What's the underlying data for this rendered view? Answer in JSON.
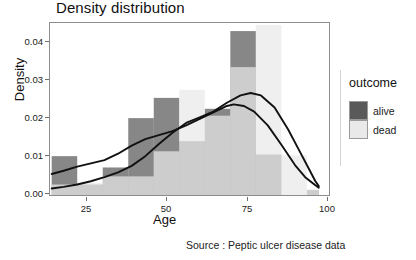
{
  "chart_data": {
    "type": "bar",
    "title": "Density distribution",
    "subtitle": "",
    "xlabel": "Age",
    "ylabel": "Density",
    "caption": "Source : Peptic ulcer disease data",
    "xlim": [
      18,
      100
    ],
    "ylim": [
      0.0,
      0.0425
    ],
    "xticks": [
      25,
      50,
      75,
      100
    ],
    "xtick_labels": [
      "25",
      "50",
      "75",
      "100"
    ],
    "yticks": [
      0.0,
      0.01,
      0.02,
      0.03,
      0.04
    ],
    "ytick_labels": [
      "0.00",
      "0.01",
      "0.02",
      "0.03",
      "0.04"
    ],
    "grid": false,
    "legend": {
      "title": "outcome",
      "position": "right",
      "entries": [
        {
          "label": "alive",
          "color": "#595959"
        },
        {
          "label": "dead",
          "color": "#e9e9e9"
        }
      ]
    },
    "bin_width": 7.5,
    "bin_edges": [
      18.5,
      26,
      33.5,
      41,
      48.5,
      56,
      63.5,
      71,
      78.5,
      86,
      93.5,
      97
    ],
    "series": [
      {
        "name": "alive",
        "color": "#595959",
        "opacity": 0.72,
        "type": "histogram",
        "bins": [
          {
            "x0": 18.5,
            "x1": 26.0,
            "density": 0.0096
          },
          {
            "x0": 26.0,
            "x1": 33.5,
            "density": 0.0026
          },
          {
            "x0": 33.5,
            "x1": 41.0,
            "density": 0.0068
          },
          {
            "x0": 41.0,
            "x1": 48.5,
            "density": 0.019
          },
          {
            "x0": 48.5,
            "x1": 56.0,
            "density": 0.024
          },
          {
            "x0": 56.0,
            "x1": 63.5,
            "density": 0.0133
          },
          {
            "x0": 63.5,
            "x1": 71.0,
            "density": 0.0213
          },
          {
            "x0": 71.0,
            "x1": 78.5,
            "density": 0.0405
          },
          {
            "x0": 78.5,
            "x1": 86.0,
            "density": 0.01
          },
          {
            "x0": 86.0,
            "x1": 93.5,
            "density": 0.0
          },
          {
            "x0": 93.5,
            "x1": 97.0,
            "density": 0.0012
          }
        ]
      },
      {
        "name": "dead",
        "color": "#e9e9e9",
        "opacity": 0.72,
        "type": "histogram",
        "bins": [
          {
            "x0": 18.5,
            "x1": 26.0,
            "density": 0.0026
          },
          {
            "x0": 26.0,
            "x1": 33.5,
            "density": 0.003
          },
          {
            "x0": 33.5,
            "x1": 41.0,
            "density": 0.0046
          },
          {
            "x0": 41.0,
            "x1": 48.5,
            "density": 0.0046
          },
          {
            "x0": 48.5,
            "x1": 56.0,
            "density": 0.0108
          },
          {
            "x0": 56.0,
            "x1": 63.5,
            "density": 0.026
          },
          {
            "x0": 63.5,
            "x1": 71.0,
            "density": 0.0196
          },
          {
            "x0": 71.0,
            "x1": 78.5,
            "density": 0.0316
          },
          {
            "x0": 78.5,
            "x1": 86.0,
            "density": 0.042
          },
          {
            "x0": 86.0,
            "x1": 93.5,
            "density": 0.0098
          },
          {
            "x0": 93.5,
            "x1": 97.0,
            "density": 0.0014
          }
        ]
      }
    ],
    "density_curves": [
      {
        "name": "alive",
        "color": "#111111",
        "peak_x": 72,
        "peak_y": 0.0224,
        "points": [
          [
            18.5,
            0.0052
          ],
          [
            22,
            0.006
          ],
          [
            26,
            0.007
          ],
          [
            30,
            0.0078
          ],
          [
            34,
            0.0086
          ],
          [
            38,
            0.0102
          ],
          [
            42,
            0.0122
          ],
          [
            46,
            0.0138
          ],
          [
            50,
            0.0148
          ],
          [
            54,
            0.0158
          ],
          [
            58,
            0.0172
          ],
          [
            62,
            0.0188
          ],
          [
            66,
            0.0204
          ],
          [
            70,
            0.022
          ],
          [
            72,
            0.0224
          ],
          [
            75,
            0.022
          ],
          [
            78,
            0.0206
          ],
          [
            82,
            0.0172
          ],
          [
            86,
            0.0124
          ],
          [
            90,
            0.0074
          ],
          [
            93,
            0.0044
          ],
          [
            96,
            0.0024
          ],
          [
            97,
            0.0018
          ]
        ]
      },
      {
        "name": "dead",
        "color": "#111111",
        "peak_x": 77,
        "peak_y": 0.0252,
        "points": [
          [
            18.5,
            0.0016
          ],
          [
            22,
            0.002
          ],
          [
            26,
            0.0026
          ],
          [
            30,
            0.0034
          ],
          [
            34,
            0.0044
          ],
          [
            38,
            0.0056
          ],
          [
            42,
            0.0072
          ],
          [
            46,
            0.0096
          ],
          [
            50,
            0.0126
          ],
          [
            54,
            0.0154
          ],
          [
            58,
            0.0178
          ],
          [
            62,
            0.0192
          ],
          [
            66,
            0.0206
          ],
          [
            70,
            0.0228
          ],
          [
            74,
            0.0246
          ],
          [
            77,
            0.0252
          ],
          [
            80,
            0.0246
          ],
          [
            84,
            0.0216
          ],
          [
            88,
            0.0162
          ],
          [
            91,
            0.0114
          ],
          [
            94,
            0.0066
          ],
          [
            96,
            0.0034
          ],
          [
            97,
            0.0022
          ]
        ]
      }
    ]
  }
}
